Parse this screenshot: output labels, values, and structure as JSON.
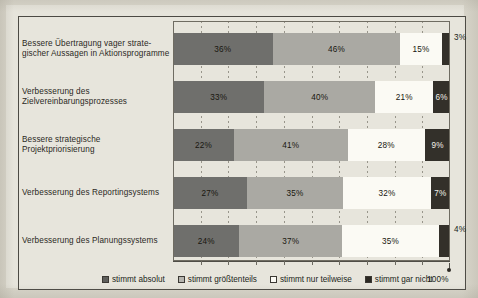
{
  "chart_data": {
    "type": "bar",
    "orientation": "horizontal",
    "stacked": true,
    "normalized": "100%",
    "title": "",
    "xlabel": "",
    "ylabel": "",
    "xlim": [
      0,
      100
    ],
    "xtick_labels": [
      "100%"
    ],
    "grid": true,
    "gridline_values": [
      10,
      20,
      30,
      40,
      50,
      60,
      70,
      80,
      90
    ],
    "legend_position": "bottom",
    "categories": [
      "Bessere Übertragung vager strate-\ngischer Aussagen in Aktionsprogramme",
      "Verbesserung des\nZielvereinbarungsprozesses",
      "Bessere strategische\nProjektpriorisierung",
      "Verbesserung des Reportingsystems",
      "Verbesserung des Planungssystems"
    ],
    "series": [
      {
        "name": "stimmt absolut",
        "color": "#6f6f6c",
        "values": [
          36,
          33,
          22,
          27,
          24
        ]
      },
      {
        "name": "stimmt größtenteils",
        "color": "#aaa9a3",
        "values": [
          46,
          40,
          41,
          35,
          37
        ]
      },
      {
        "name": "stimmt nur teilweise",
        "color": "#fbfaf4",
        "values": [
          15,
          21,
          28,
          32,
          35
        ]
      },
      {
        "name": "stimmt gar nicht",
        "color": "#33302a",
        "values": [
          3,
          6,
          9,
          7,
          4
        ]
      }
    ]
  },
  "rows": [
    {
      "label_line1": "Bessere Übertragung vager strate-",
      "label_line2": "gischer Aussagen in Aktionsprogramme",
      "segments": [
        {
          "value": 36,
          "text": "36%",
          "outside": false
        },
        {
          "value": 46,
          "text": "46%",
          "outside": false
        },
        {
          "value": 15,
          "text": "15%",
          "outside": false
        },
        {
          "value": 3,
          "text": "3%",
          "outside": true
        }
      ]
    },
    {
      "label_line1": "Verbesserung des",
      "label_line2": "Zielvereinbarungsprozesses",
      "segments": [
        {
          "value": 33,
          "text": "33%",
          "outside": false
        },
        {
          "value": 40,
          "text": "40%",
          "outside": false
        },
        {
          "value": 21,
          "text": "21%",
          "outside": false
        },
        {
          "value": 6,
          "text": "6%",
          "outside": false
        }
      ]
    },
    {
      "label_line1": "Bessere strategische",
      "label_line2": "Projektpriorisierung",
      "segments": [
        {
          "value": 22,
          "text": "22%",
          "outside": false
        },
        {
          "value": 41,
          "text": "41%",
          "outside": false
        },
        {
          "value": 28,
          "text": "28%",
          "outside": false
        },
        {
          "value": 9,
          "text": "9%",
          "outside": false
        }
      ]
    },
    {
      "label_line1": "Verbesserung des Reportingsystems",
      "label_line2": "",
      "segments": [
        {
          "value": 27,
          "text": "27%",
          "outside": false
        },
        {
          "value": 35,
          "text": "35%",
          "outside": false
        },
        {
          "value": 32,
          "text": "32%",
          "outside": false
        },
        {
          "value": 7,
          "text": "7%",
          "outside": false
        }
      ]
    },
    {
      "label_line1": "Verbesserung des Planungssystems",
      "label_line2": "",
      "segments": [
        {
          "value": 24,
          "text": "24%",
          "outside": false
        },
        {
          "value": 37,
          "text": "37%",
          "outside": false
        },
        {
          "value": 35,
          "text": "35%",
          "outside": false
        },
        {
          "value": 4,
          "text": "4%",
          "outside": true
        }
      ]
    }
  ],
  "legend": {
    "items": [
      {
        "label": "stimmt absolut",
        "swatch": "sw0"
      },
      {
        "label": "stimmt größtenteils",
        "swatch": "sw1"
      },
      {
        "label": "stimmt nur teilweise",
        "swatch": "sw2"
      },
      {
        "label": "stimmt gar nicht",
        "swatch": "sw3"
      }
    ],
    "axis_end_label": "100%"
  }
}
